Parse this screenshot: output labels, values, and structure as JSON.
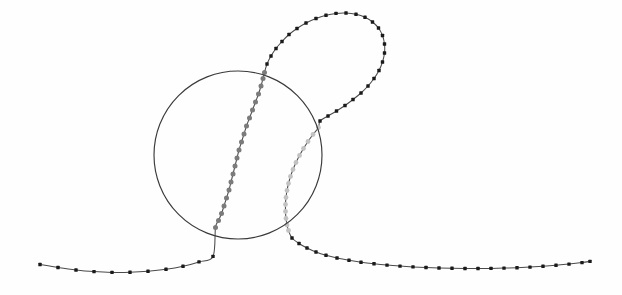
{
  "figure": {
    "title": "",
    "background_color": "#fefefe",
    "width": 622,
    "height": 295
  },
  "chart_data": {
    "type": "scatter",
    "title": "",
    "subtitle": "",
    "xlabel": "",
    "ylabel": "",
    "xlim": [
      0,
      622
    ],
    "ylim": [
      0,
      295
    ],
    "grid": false,
    "legend": null,
    "annotations": [],
    "tick_labels": {
      "x": [],
      "y": []
    },
    "shapes": [
      {
        "name": "region-circle",
        "type": "circle",
        "cx": 238,
        "cy": 155,
        "r": 84,
        "stroke": "#3a3a3a",
        "stroke_width": 1.15,
        "fill": "none"
      }
    ],
    "series": [
      {
        "name": "trajectory-outside-left",
        "marker": "square",
        "marker_size": 3.4,
        "color": "#1a1a1a",
        "line_color": "#4a4a4a",
        "points": [
          [
            40,
            264.5
          ],
          [
            58,
            267.5
          ],
          [
            76,
            270.0
          ],
          [
            94,
            271.6
          ],
          [
            112,
            272.4
          ],
          [
            130,
            272.3
          ],
          [
            148,
            271.3
          ],
          [
            166,
            269.3
          ],
          [
            183,
            266.2
          ],
          [
            199,
            261.9
          ],
          [
            213,
            256.4
          ]
        ]
      },
      {
        "name": "trajectory-inside-ascending",
        "marker": "circle",
        "marker_size": 5.0,
        "color": "#7b7b7b",
        "line_color": "#6f6f6f",
        "points": [
          [
            215.5,
            227.5
          ],
          [
            218.5,
            220.5
          ],
          [
            221.5,
            213.5
          ],
          [
            224.0,
            206.0
          ],
          [
            226.5,
            198.0
          ],
          [
            229.0,
            190.0
          ],
          [
            231.0,
            182.0
          ],
          [
            233.0,
            174.0
          ],
          [
            235.0,
            166.0
          ],
          [
            237.0,
            158.0
          ],
          [
            239.0,
            150.0
          ],
          [
            241.5,
            142.0
          ],
          [
            244.0,
            134.0
          ],
          [
            246.5,
            126.0
          ],
          [
            249.5,
            118.0
          ],
          [
            252.5,
            110.0
          ],
          [
            255.5,
            102.0
          ],
          [
            258.5,
            94.0
          ],
          [
            261.0,
            86.0
          ],
          [
            263.0,
            78.5
          ],
          [
            264.5,
            72.5
          ]
        ]
      },
      {
        "name": "trajectory-loop-outside",
        "marker": "square",
        "marker_size": 3.4,
        "color": "#1a1a1a",
        "line_color": "#4a4a4a",
        "points": [
          [
            267.0,
            64.0
          ],
          [
            271.0,
            56.0
          ],
          [
            276.0,
            48.5
          ],
          [
            282.0,
            41.5
          ],
          [
            289.0,
            34.5
          ],
          [
            297.0,
            28.5
          ],
          [
            306.0,
            23.0
          ],
          [
            316.0,
            18.5
          ],
          [
            326.0,
            15.3
          ],
          [
            336.0,
            13.4
          ],
          [
            346.0,
            13.0
          ],
          [
            356.0,
            14.3
          ],
          [
            365.0,
            17.3
          ],
          [
            372.5,
            22.0
          ],
          [
            378.5,
            28.0
          ],
          [
            382.5,
            35.5
          ],
          [
            384.5,
            44.0
          ],
          [
            384.5,
            53.0
          ],
          [
            382.5,
            62.0
          ],
          [
            379.0,
            70.5
          ],
          [
            374.0,
            78.5
          ],
          [
            368.0,
            86.0
          ],
          [
            361.0,
            93.0
          ],
          [
            353.0,
            99.5
          ],
          [
            345.0,
            105.5
          ],
          [
            336.5,
            111.0
          ],
          [
            328.0,
            116.0
          ],
          [
            320.0,
            121.0
          ]
        ]
      },
      {
        "name": "trajectory-inside-descending",
        "marker": "circle",
        "marker_size": 4.8,
        "color": "#c2c2c2",
        "line_color": "#a8a8a8",
        "points": [
          [
            318.5,
            127.5
          ],
          [
            313.0,
            134.5
          ],
          [
            308.0,
            141.5
          ],
          [
            303.5,
            148.5
          ],
          [
            299.5,
            155.5
          ],
          [
            296.0,
            162.5
          ],
          [
            293.0,
            169.5
          ],
          [
            290.5,
            176.5
          ],
          [
            288.5,
            183.5
          ],
          [
            287.0,
            190.5
          ],
          [
            286.0,
            197.5
          ],
          [
            285.5,
            204.5
          ],
          [
            285.5,
            211.5
          ],
          [
            286.0,
            218.5
          ],
          [
            287.0,
            225.0
          ],
          [
            288.5,
            230.5
          ]
        ]
      },
      {
        "name": "trajectory-outside-right",
        "marker": "square",
        "marker_size": 3.4,
        "color": "#1a1a1a",
        "line_color": "#4a4a4a",
        "points": [
          [
            292.0,
            238.0
          ],
          [
            299.0,
            243.5
          ],
          [
            307.0,
            248.0
          ],
          [
            316.0,
            252.0
          ],
          [
            326.0,
            255.3
          ],
          [
            337.0,
            258.0
          ],
          [
            349.0,
            260.3
          ],
          [
            361.0,
            262.2
          ],
          [
            374.0,
            263.8
          ],
          [
            387.0,
            265.1
          ],
          [
            400.0,
            266.1
          ],
          [
            413.0,
            266.9
          ],
          [
            426.0,
            267.5
          ],
          [
            439.0,
            268.0
          ],
          [
            452.0,
            268.3
          ],
          [
            465.0,
            268.5
          ],
          [
            478.0,
            268.5
          ],
          [
            491.0,
            268.4
          ],
          [
            504.0,
            268.1
          ],
          [
            517.0,
            267.7
          ],
          [
            530.0,
            267.1
          ],
          [
            543.0,
            266.3
          ],
          [
            556.0,
            265.3
          ],
          [
            569.0,
            264.1
          ],
          [
            582.0,
            262.6
          ],
          [
            590.0,
            261.4
          ]
        ]
      }
    ]
  }
}
